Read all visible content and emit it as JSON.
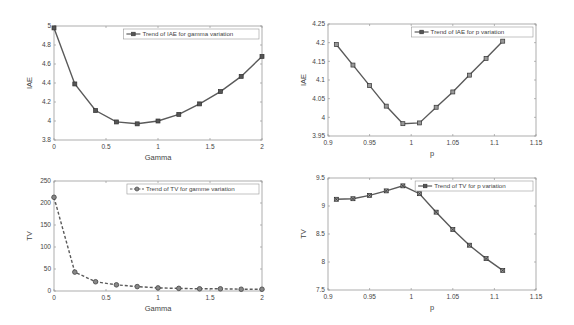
{
  "chart_data": [
    {
      "id": "iae_gamma",
      "type": "line",
      "title": "",
      "xlabel": "Gamma",
      "ylabel": "IAE",
      "xlim": [
        0,
        2
      ],
      "ylim": [
        3.8,
        5
      ],
      "xticks": [
        0,
        0.5,
        1,
        1.5,
        2
      ],
      "xtick_labels": [
        "0",
        "0.5",
        "1",
        "1.5",
        "2"
      ],
      "yticks": [
        3.8,
        4,
        4.2,
        4.4,
        4.6,
        4.8,
        5
      ],
      "ytick_labels": [
        "3.8",
        "4",
        "4.2",
        "4.4",
        "4.6",
        "4.8",
        "5"
      ],
      "grid": false,
      "legend_position": "upper right",
      "series": [
        {
          "name": "Trend of IAE for gamma variation",
          "line_style": "solid",
          "marker": "square",
          "x": [
            0,
            0.2,
            0.4,
            0.6,
            0.8,
            1.0,
            1.2,
            1.4,
            1.6,
            1.8,
            2.0
          ],
          "values": [
            4.98,
            4.39,
            4.11,
            3.99,
            3.97,
            4.0,
            4.07,
            4.18,
            4.31,
            4.47,
            4.68
          ]
        }
      ]
    },
    {
      "id": "iae_p",
      "type": "line",
      "title": "",
      "xlabel": "p",
      "ylabel": "IAE",
      "xlim": [
        0.9,
        1.15
      ],
      "ylim": [
        3.95,
        4.25
      ],
      "xticks": [
        0.9,
        0.95,
        1,
        1.05,
        1.1,
        1.15
      ],
      "xtick_labels": [
        "0.9",
        "0.95",
        "1",
        "1.05",
        "1.1",
        "1.15"
      ],
      "yticks": [
        3.95,
        4,
        4.05,
        4.1,
        4.15,
        4.2,
        4.25
      ],
      "ytick_labels": [
        "3.95",
        "4",
        "4.05",
        "4.1",
        "4.15",
        "4.2",
        "4.25"
      ],
      "grid": false,
      "legend_position": "upper right",
      "series": [
        {
          "name": "Trend of IAE for p variation",
          "line_style": "solid",
          "marker": "circle-square",
          "x": [
            0.91,
            0.93,
            0.95,
            0.97,
            0.99,
            1.01,
            1.03,
            1.05,
            1.07,
            1.09,
            1.11
          ],
          "values": [
            4.195,
            4.14,
            4.085,
            4.03,
            3.983,
            3.985,
            4.027,
            4.068,
            4.113,
            4.158,
            4.204
          ]
        }
      ]
    },
    {
      "id": "tv_gamma",
      "type": "line",
      "title": "",
      "xlabel": "Gamma",
      "ylabel": "TV",
      "xlim": [
        0,
        2
      ],
      "ylim": [
        0,
        250
      ],
      "xticks": [
        0,
        0.5,
        1,
        1.5,
        2
      ],
      "xtick_labels": [
        "0",
        "0.5",
        "1",
        "1.5",
        "2"
      ],
      "yticks": [
        0,
        50,
        100,
        150,
        200,
        250
      ],
      "ytick_labels": [
        "0",
        "50",
        "100",
        "150",
        "200",
        "250"
      ],
      "grid": false,
      "legend_position": "upper right",
      "series": [
        {
          "name": "Trend of TV for gamme variation",
          "line_style": "dashed",
          "marker": "circle",
          "x": [
            0,
            0.2,
            0.4,
            0.6,
            0.8,
            1.0,
            1.2,
            1.4,
            1.6,
            1.8,
            2.0
          ],
          "values": [
            213,
            43,
            21,
            14,
            10,
            7,
            6,
            5,
            5,
            4,
            4
          ]
        }
      ]
    },
    {
      "id": "tv_p",
      "type": "line",
      "title": "",
      "xlabel": "p",
      "ylabel": "TV",
      "xlim": [
        0.9,
        1.15
      ],
      "ylim": [
        7.5,
        9.5
      ],
      "xticks": [
        0.9,
        0.95,
        1,
        1.05,
        1.1,
        1.15
      ],
      "xtick_labels": [
        "0.9",
        "0.95",
        "1",
        "1.05",
        "1.1",
        "1.15"
      ],
      "yticks": [
        7.5,
        8,
        8.5,
        9,
        9.5
      ],
      "ytick_labels": [
        "7.5",
        "8",
        "8.5",
        "9",
        "9.5"
      ],
      "grid": false,
      "legend_position": "upper right",
      "series": [
        {
          "name": "Trend of TV for p variation",
          "line_style": "solid",
          "marker": "x-square",
          "x": [
            0.91,
            0.93,
            0.95,
            0.97,
            0.99,
            1.01,
            1.03,
            1.05,
            1.07,
            1.09,
            1.11
          ],
          "values": [
            9.12,
            9.13,
            9.19,
            9.27,
            9.36,
            9.22,
            8.89,
            8.58,
            8.3,
            8.06,
            7.85
          ]
        }
      ]
    }
  ],
  "layout": {
    "panels": [
      {
        "left": 54,
        "top": 26,
        "width": 208,
        "height": 114
      },
      {
        "left": 328,
        "top": 24,
        "width": 208,
        "height": 112
      },
      {
        "left": 54,
        "top": 181,
        "width": 208,
        "height": 110
      },
      {
        "left": 328,
        "top": 178,
        "width": 208,
        "height": 112
      }
    ],
    "colors": {
      "line": "#5a5a5a",
      "axis": "#9a9a9a",
      "marker_fill": "#555555",
      "legend_border": "#999999"
    }
  }
}
